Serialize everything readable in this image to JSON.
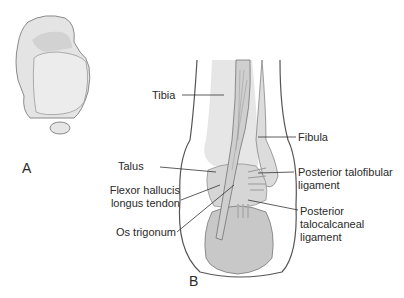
{
  "figure": {
    "panels": [
      {
        "id": "A",
        "label": "A"
      },
      {
        "id": "B",
        "label": "B"
      }
    ],
    "labels": {
      "tibia": "Tibia",
      "fibula": "Fibula",
      "talus": "Talus",
      "flexor_line1": "Flexor hallucis",
      "flexor_line2": "longus tendon",
      "os_trigonum": "Os trigonum",
      "ptfl_line1": "Posterior talofibular",
      "ptfl_line2": "ligament",
      "ptcl_line1": "Posterior",
      "ptcl_line2": "talocalcaneal",
      "ptcl_line3": "ligament"
    },
    "colors": {
      "bone_fill": "#e2e2e2",
      "bone_shade": "#c9c9c9",
      "outline": "#555555",
      "leader": "#333333"
    }
  }
}
